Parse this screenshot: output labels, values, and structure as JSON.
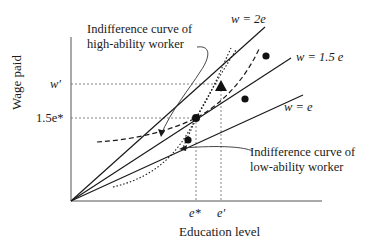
{
  "figure": {
    "axes": {
      "x_label": "Education level",
      "y_label": "Wage paid",
      "x_ticks": [
        "e*",
        "e′"
      ],
      "y_ticks": [
        "w′",
        "1.5e*"
      ]
    },
    "lines": [
      {
        "label": "w = 2e",
        "slope": 2
      },
      {
        "label": "w = 1.5 e",
        "slope": 1.5
      },
      {
        "label": "w = e",
        "slope": 1
      }
    ],
    "annotations": {
      "high_curve_line1": "Indifference curve of",
      "high_curve_line2": "high-ability worker",
      "low_curve_line1": "Indifference curve of",
      "low_curve_line2": "low-ability worker"
    },
    "curves": [
      {
        "name": "Indifference curve of high-ability worker",
        "style": "dashed"
      },
      {
        "name": "Indifference curve of low-ability worker",
        "style": "dotted"
      }
    ],
    "markers": [
      {
        "shape": "circle",
        "at": "(e*, 1.5e*)"
      },
      {
        "shape": "triangle",
        "at": "(e′, w′)"
      },
      {
        "shape": "circle",
        "at": "above w = 1.5e"
      },
      {
        "shape": "circle",
        "at": "between w = 1.5e and w = e"
      },
      {
        "shape": "circle",
        "at": "near low-ability curve"
      }
    ],
    "colors": {
      "ink": "#1a1a1a",
      "axis": "#555555",
      "guide": "#666666"
    }
  }
}
